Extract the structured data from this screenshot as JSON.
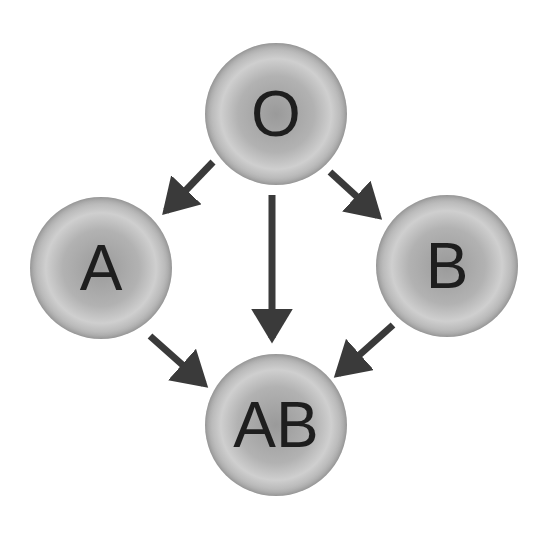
{
  "diagram": {
    "title": "",
    "colors": {
      "background": "#ffffff",
      "node_fill": "#b0b0b0",
      "arrow": "#3a3a3a",
      "label": "#1e1e1e"
    },
    "nodes": [
      {
        "id": "O",
        "label": "O"
      },
      {
        "id": "A",
        "label": "A"
      },
      {
        "id": "B",
        "label": "B"
      },
      {
        "id": "AB",
        "label": "AB"
      }
    ],
    "edges": [
      {
        "from": "O",
        "to": "A"
      },
      {
        "from": "O",
        "to": "B"
      },
      {
        "from": "O",
        "to": "AB"
      },
      {
        "from": "A",
        "to": "AB"
      },
      {
        "from": "B",
        "to": "AB"
      }
    ]
  }
}
